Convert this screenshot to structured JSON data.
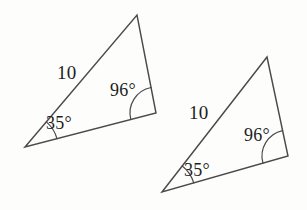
{
  "figure": {
    "kind": "geometry-diagram",
    "background_color": "#fdfdfc",
    "stroke_color": "#4a4a4a",
    "text_color": "#1d1d1d",
    "triangles": [
      {
        "name": "triangle-left",
        "vertices": {
          "bottom_left": {
            "x": 25,
            "y": 147
          },
          "apex": {
            "x": 137,
            "y": 15
          },
          "bottom_right": {
            "x": 156,
            "y": 113
          }
        },
        "labels": {
          "side": "10",
          "angle_bottom_left": "35°",
          "angle_bottom_right": "96°"
        },
        "label_positions": {
          "side": {
            "x": 57,
            "y": 63
          },
          "angle_bottom_left": {
            "x": 46,
            "y": 114
          },
          "angle_bottom_right": {
            "x": 110,
            "y": 81
          }
        }
      },
      {
        "name": "triangle-right",
        "vertices": {
          "bottom_left": {
            "x": 162,
            "y": 192
          },
          "apex": {
            "x": 267,
            "y": 57
          },
          "bottom_right": {
            "x": 288,
            "y": 156
          }
        },
        "labels": {
          "side": "10",
          "angle_bottom_left": "35°",
          "angle_bottom_right": "96°"
        },
        "label_positions": {
          "side": {
            "x": 189,
            "y": 103
          },
          "angle_bottom_left": {
            "x": 184,
            "y": 161
          },
          "angle_bottom_right": {
            "x": 244,
            "y": 126
          }
        }
      }
    ]
  }
}
